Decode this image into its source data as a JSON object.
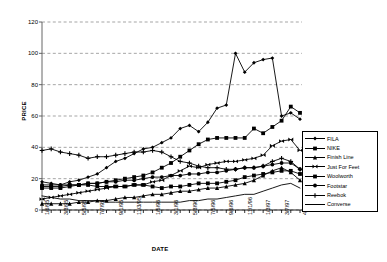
{
  "chart_data": {
    "type": "line",
    "title": "",
    "xlabel": "DATE",
    "ylabel": "PRICE",
    "ylim": [
      0,
      120
    ],
    "yticks": [
      0,
      20,
      40,
      60,
      80,
      100,
      120
    ],
    "grid": true,
    "grid_style": "dashed-horizontal",
    "legend_position": "right",
    "x": [
      "1/6/95",
      "2/3/95",
      "3/3/95",
      "4/7/95",
      "5/5/95",
      "6/2/95",
      "7/7/95",
      "8/4/95",
      "9/1/95",
      "10/6/95",
      "11/3/95",
      "12/1/95",
      "1/5/96",
      "2/2/96",
      "3/1/96",
      "4/5/96",
      "5/3/96",
      "6/7/96",
      "7/5/96",
      "8/2/96",
      "9/6/96",
      "10/4/96",
      "11/1/96",
      "12/6/96",
      "1/3/97",
      "2/7/97",
      "3/7/97",
      "4/4/97",
      "4/25/97"
    ],
    "xtick_labels": [
      "1/6/95",
      "3/3/95",
      "5/5/95",
      "7/7/95",
      "9/1/95",
      "11/3/95",
      "1/5/96",
      "3/1/96",
      "5/3/96",
      "7/5/96",
      "9/6/96",
      "11/1/96",
      "1/3/97",
      "3/7/97",
      "4/25/97"
    ],
    "series": [
      {
        "name": "FILA",
        "marker": "diamond",
        "values": [
          18,
          17,
          16,
          18,
          19,
          21,
          23,
          27,
          31,
          33,
          36,
          39,
          40,
          43,
          46,
          52,
          54,
          50,
          56,
          65,
          67,
          100,
          88,
          94,
          96,
          97,
          60,
          62,
          58
        ]
      },
      {
        "name": "NIKE",
        "marker": "square",
        "values": [
          14,
          14,
          14,
          15,
          16,
          17,
          17,
          18,
          19,
          20,
          21,
          22,
          24,
          27,
          30,
          34,
          38,
          42,
          45,
          46,
          46,
          46,
          46,
          52,
          49,
          53,
          57,
          66,
          62
        ]
      },
      {
        "name": "Finish Line",
        "marker": "triangle",
        "values": [
          4,
          4,
          4,
          4,
          5,
          5,
          6,
          6,
          7,
          8,
          8,
          9,
          10,
          10,
          11,
          12,
          12,
          13,
          14,
          14,
          15,
          16,
          17,
          19,
          22,
          25,
          27,
          24,
          19
        ]
      },
      {
        "name": "Just For Feet",
        "marker": "bowtie",
        "values": [
          7,
          8,
          9,
          10,
          11,
          12,
          13,
          14,
          15,
          15,
          16,
          16,
          18,
          19,
          22,
          25,
          28,
          27,
          29,
          30,
          31,
          31,
          32,
          33,
          35,
          41,
          44,
          45,
          38
        ]
      },
      {
        "name": "Woolworth",
        "marker": "square",
        "values": [
          15,
          15,
          15,
          16,
          16,
          16,
          15,
          15,
          15,
          15,
          16,
          16,
          15,
          14,
          15,
          15,
          16,
          17,
          17,
          17,
          18,
          19,
          21,
          22,
          23,
          24,
          25,
          25,
          23
        ]
      },
      {
        "name": "Footstar",
        "marker": "circle",
        "values": [
          16,
          16,
          16,
          16,
          16,
          17,
          17,
          18,
          18,
          19,
          19,
          20,
          21,
          21,
          22,
          22,
          23,
          23,
          24,
          24,
          25,
          26,
          27,
          27,
          28,
          29,
          30,
          30,
          26
        ]
      },
      {
        "name": "Reebok",
        "marker": "plus",
        "values": [
          38,
          39,
          37,
          36,
          35,
          33,
          34,
          34,
          35,
          36,
          37,
          37,
          38,
          37,
          34,
          31,
          30,
          28,
          27,
          27,
          26,
          26,
          27,
          27,
          28,
          31,
          33,
          31,
          26
        ]
      },
      {
        "name": "Converse",
        "marker": "none",
        "values": [
          9,
          8,
          7,
          7,
          6,
          6,
          6,
          5,
          5,
          5,
          5,
          5,
          5,
          5,
          5,
          5,
          6,
          6,
          7,
          7,
          8,
          9,
          10,
          10,
          12,
          14,
          16,
          17,
          14
        ]
      }
    ]
  },
  "legend": {
    "entries": [
      {
        "label": "FILA"
      },
      {
        "label": "NIKE"
      },
      {
        "label": "Finish Line"
      },
      {
        "label": "Just For Feet"
      },
      {
        "label": "Woolworth"
      },
      {
        "label": "Footstar"
      },
      {
        "label": "Reebok"
      },
      {
        "label": "Converse"
      }
    ]
  },
  "colors": {
    "line": "#000000",
    "grid": "#808080",
    "axis": "#808080",
    "background": "#ffffff"
  }
}
